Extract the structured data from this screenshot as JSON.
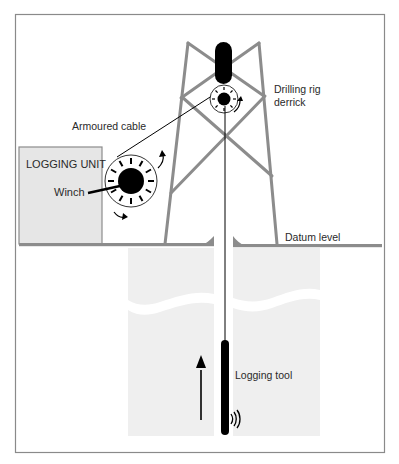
{
  "diagram": {
    "labels": {
      "logging_unit": "LOGGING UNIT",
      "winch": "Winch",
      "armoured_cable": "Armoured cable",
      "derrick_line1": "Drilling rig",
      "derrick_line2": "derrick",
      "datum_level": "Datum level",
      "logging_tool": "Logging tool"
    },
    "colors": {
      "frame": "#8a8a8a",
      "structure_grey": "#8c8c8c",
      "unit_fill": "#e8e8e8",
      "earth_fill": "#efefef",
      "black": "#000000",
      "text": "#2a2a2a"
    },
    "components": [
      "logging-unit",
      "winch",
      "armoured-cable",
      "drilling-rig-derrick",
      "crown-sheave",
      "borehole",
      "logging-tool",
      "ascending-direction-arrow",
      "signal-waves"
    ]
  }
}
